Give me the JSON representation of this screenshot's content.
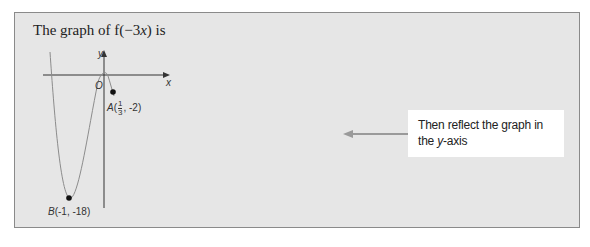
{
  "title": {
    "prefix": "The graph of f(−3",
    "var": "x",
    "suffix": ") is"
  },
  "axes": {
    "x_label": "x",
    "y_label": "y",
    "origin_label": "O"
  },
  "points": {
    "A": {
      "name": "A",
      "x_num": "1",
      "x_den": "3",
      "y": "-2",
      "suffix": ", -2)"
    },
    "B": {
      "name": "B",
      "label": "(-1, -18)"
    }
  },
  "note": {
    "line1": "Then reflect the graph in",
    "line2_prefix": "the ",
    "line2_var": "y",
    "line2_suffix": "-axis"
  },
  "colors": {
    "panel_bg": "#e6e6e6",
    "panel_border": "#8a8a8a",
    "curve": "#8c8c8c",
    "axis": "#333333",
    "arrow": "#9a9a9a",
    "note_bg": "#ffffff"
  }
}
